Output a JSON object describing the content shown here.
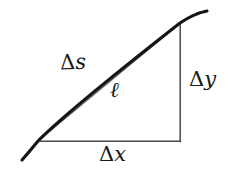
{
  "figure": {
    "name": "arc-length-differential-triangle",
    "background_color": "#ffffff",
    "width": 228,
    "height": 169,
    "labels": {
      "arc_delta": "Δ",
      "arc_var": "s",
      "chord": "ℓ",
      "rise_delta": "Δ",
      "rise_var": "y",
      "run_delta": "Δ",
      "run_var": "x"
    },
    "colors": {
      "arc_stroke": "#161616",
      "chord_stroke": "#6b6b6b",
      "leg_stroke": "#4a4a4a",
      "label_text": "#181818"
    },
    "geometry": {
      "vertex_bottom_left": [
        38,
        141
      ],
      "vertex_top_right": [
        180,
        23
      ],
      "vertex_bottom_right": [
        180,
        141
      ],
      "arc_start_extension": [
        22,
        160
      ],
      "arc_end_extension": [
        207,
        11
      ],
      "arc_control": [
        105,
        44
      ],
      "run_length_px": 142,
      "rise_length_px": 118
    },
    "strokes": {
      "arc_width": 3.1,
      "chord_width": 1.0,
      "leg_width": 1.4
    }
  }
}
